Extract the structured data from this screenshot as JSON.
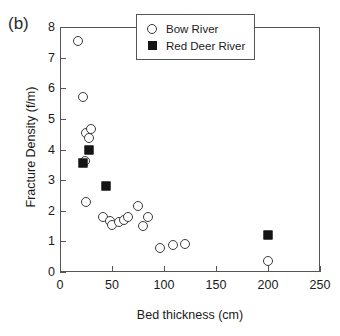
{
  "figure": {
    "panel_label": "(b)"
  },
  "legend": {
    "position": "top-right-inside",
    "entries": [
      {
        "label": "Bow River",
        "marker": "open-circle",
        "color": "#3a3a3a"
      },
      {
        "label": "Red Deer River",
        "marker": "filled-square",
        "color": "#141414"
      }
    ]
  },
  "chart_data": {
    "type": "scatter",
    "title": "",
    "subtitle": "",
    "panel_label": "(b)",
    "xlabel": "Bed thickness (cm)",
    "ylabel": "Fracture Density (f/m)",
    "xlim": [
      0,
      250
    ],
    "ylim": [
      0,
      8
    ],
    "xticks": [
      0,
      50,
      100,
      150,
      200,
      250
    ],
    "yticks": [
      0,
      1,
      2,
      3,
      4,
      5,
      6,
      7,
      8
    ],
    "xtick_labels": [
      "0",
      "50",
      "100",
      "150",
      "200",
      "250"
    ],
    "ytick_labels": [
      "0",
      "1",
      "2",
      "3",
      "4",
      "5",
      "6",
      "7",
      "8"
    ],
    "grid": false,
    "series": [
      {
        "name": "Bow River",
        "marker": "open-circle",
        "color": "#3a3a3a",
        "points": [
          {
            "x": 17,
            "y": 7.55
          },
          {
            "x": 22,
            "y": 5.7
          },
          {
            "x": 25,
            "y": 4.55
          },
          {
            "x": 30,
            "y": 4.67
          },
          {
            "x": 28,
            "y": 4.38
          },
          {
            "x": 24,
            "y": 3.63
          },
          {
            "x": 25,
            "y": 2.28
          },
          {
            "x": 41,
            "y": 1.8
          },
          {
            "x": 48,
            "y": 1.68
          },
          {
            "x": 50,
            "y": 1.55
          },
          {
            "x": 57,
            "y": 1.62
          },
          {
            "x": 62,
            "y": 1.7
          },
          {
            "x": 65,
            "y": 1.8
          },
          {
            "x": 75,
            "y": 2.16
          },
          {
            "x": 80,
            "y": 1.5
          },
          {
            "x": 85,
            "y": 1.8
          },
          {
            "x": 96,
            "y": 0.8
          },
          {
            "x": 109,
            "y": 0.87
          },
          {
            "x": 120,
            "y": 0.93
          },
          {
            "x": 200,
            "y": 0.35
          }
        ]
      },
      {
        "name": "Red Deer River",
        "marker": "filled-square",
        "color": "#141414",
        "points": [
          {
            "x": 28,
            "y": 3.97
          },
          {
            "x": 22,
            "y": 3.55
          },
          {
            "x": 44,
            "y": 2.82
          },
          {
            "x": 200,
            "y": 1.22
          }
        ]
      }
    ]
  }
}
